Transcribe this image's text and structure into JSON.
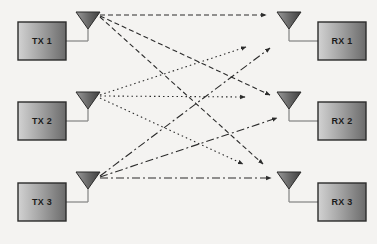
{
  "diagram": {
    "background_color": "#f4f3f1",
    "box": {
      "width": 48,
      "height": 38,
      "fill_light": "#cfcfcf",
      "fill_dark": "#6f6f6f",
      "border_color": "#2b2b2b",
      "label_color": "#1b1b1b"
    },
    "antenna": {
      "fill_light": "#8a8a8a",
      "fill_dark": "#4a4a4a",
      "outline_color": "#2b2b2b",
      "stem_color": "#7a7a7a",
      "width": 24,
      "height": 17
    },
    "connector_color": "#8a8a8a",
    "link_color": "#2b2b2b"
  },
  "transmitters": [
    {
      "id": "tx1",
      "label": "TX 1",
      "box_x": 18,
      "box_y": 22,
      "antenna_cx": 88,
      "antenna_top": 12,
      "feed_y": 41,
      "source_x": 100,
      "source_y": 15,
      "line_style": "dashed",
      "dash_array": "5,3"
    },
    {
      "id": "tx2",
      "label": "TX 2",
      "box_x": 18,
      "box_y": 102,
      "antenna_cx": 88,
      "antenna_top": 92,
      "feed_y": 121,
      "source_x": 100,
      "source_y": 96,
      "line_style": "dotted",
      "dash_array": "1.5,3"
    },
    {
      "id": "tx3",
      "label": "TX 3",
      "box_x": 18,
      "box_y": 183,
      "antenna_cx": 88,
      "antenna_top": 172,
      "feed_y": 202,
      "source_x": 100,
      "source_y": 177,
      "line_style": "dash-dot",
      "dash_array": "8,3,2,3"
    }
  ],
  "receivers": [
    {
      "id": "rx1",
      "label": "RX 1",
      "box_x": 318,
      "box_y": 22,
      "antenna_cx": 289,
      "antenna_top": 12,
      "feed_y": 41,
      "target_x": 268,
      "target_y": 15
    },
    {
      "id": "rx2",
      "label": "RX 2",
      "box_x": 318,
      "box_y": 102,
      "antenna_cx": 289,
      "antenna_top": 92,
      "feed_y": 121,
      "target_x": 268,
      "target_y": 96
    },
    {
      "id": "rx3",
      "label": "RX 3",
      "box_x": 318,
      "box_y": 183,
      "antenna_cx": 289,
      "antenna_top": 172,
      "feed_y": 202,
      "target_x": 268,
      "target_y": 177
    }
  ],
  "links": [
    {
      "id": "h11",
      "from": "tx1",
      "to": "rx1",
      "style": "dashed",
      "dash_array": "5,3",
      "x1": 100,
      "y1": 15,
      "x2": 266,
      "y2": 15
    },
    {
      "id": "h12",
      "from": "tx1",
      "to": "rx2",
      "style": "dashed",
      "dash_array": "5,3",
      "x1": 100,
      "y1": 16,
      "x2": 270,
      "y2": 95
    },
    {
      "id": "h13",
      "from": "tx1",
      "to": "rx3",
      "style": "dashed",
      "dash_array": "5,3",
      "x1": 100,
      "y1": 17,
      "x2": 263,
      "y2": 164
    },
    {
      "id": "h21",
      "from": "tx2",
      "to": "rx1",
      "style": "dotted",
      "dash_array": "1.5,3",
      "x1": 100,
      "y1": 95,
      "x2": 246,
      "y2": 47
    },
    {
      "id": "h22",
      "from": "tx2",
      "to": "rx2",
      "style": "dotted",
      "dash_array": "1.5,3",
      "x1": 100,
      "y1": 96,
      "x2": 245,
      "y2": 97
    },
    {
      "id": "h23",
      "from": "tx2",
      "to": "rx3",
      "style": "dotted",
      "dash_array": "1.5,3",
      "x1": 100,
      "y1": 98,
      "x2": 243,
      "y2": 164
    },
    {
      "id": "h31",
      "from": "tx3",
      "to": "rx1",
      "style": "dash-dot",
      "dash_array": "8,3,2,3",
      "x1": 100,
      "y1": 176,
      "x2": 270,
      "y2": 48
    },
    {
      "id": "h32",
      "from": "tx3",
      "to": "rx2",
      "style": "dash-dot",
      "dash_array": "8,3,2,3",
      "x1": 100,
      "y1": 177,
      "x2": 277,
      "y2": 118
    },
    {
      "id": "h33",
      "from": "tx3",
      "to": "rx3",
      "style": "dash-dot",
      "dash_array": "8,3,2,3",
      "x1": 100,
      "y1": 178,
      "x2": 271,
      "y2": 178
    }
  ]
}
